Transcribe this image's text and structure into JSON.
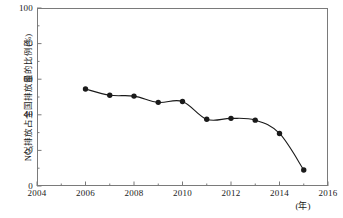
{
  "chart_data": {
    "type": "line",
    "title": "",
    "subtitle": "",
    "xlabel": "(年)",
    "ylabel": "NOx排放占全国排放量的比例(%)",
    "ylabel_parts": {
      "prefix": "NO",
      "sub": "x",
      "suffix": "排放占全国排放量的比例(%)"
    },
    "xlim": [
      2004,
      2016
    ],
    "ylim": [
      0,
      100
    ],
    "x_major_ticks": [
      2004,
      2006,
      2008,
      2010,
      2012,
      2014,
      2016
    ],
    "x_tick_labels": [
      "2004",
      "2006",
      "2008",
      "2010",
      "2012",
      "2014",
      "2016"
    ],
    "x_minor_ticks": [
      2005,
      2007,
      2009,
      2011,
      2013,
      2015
    ],
    "y_major_ticks": [
      0,
      20,
      40,
      60,
      80,
      100
    ],
    "y_tick_labels": [
      "0",
      "20",
      "40",
      "60",
      "80",
      "100"
    ],
    "y_minor_ticks": [
      10,
      30,
      50,
      70,
      90
    ],
    "grid": false,
    "legend": false,
    "legend_position": "none",
    "marker": "filled-circle",
    "line_color": "#1a1a1a",
    "marker_color": "#1a1a1a",
    "axis_color": "#7a7a7a",
    "x": [
      2006,
      2007,
      2008,
      2009,
      2010,
      2011,
      2012,
      2013,
      2014,
      2015
    ],
    "values": [
      54.5,
      51.0,
      50.5,
      47.0,
      47.5,
      37.5,
      38.0,
      37.0,
      29.5,
      9.0
    ],
    "series": [
      {
        "name": "NOx排放占全国排放量的比例",
        "values": [
          54.5,
          51.0,
          50.5,
          47.0,
          47.5,
          37.5,
          38.0,
          37.0,
          29.5,
          9.0
        ]
      }
    ]
  }
}
